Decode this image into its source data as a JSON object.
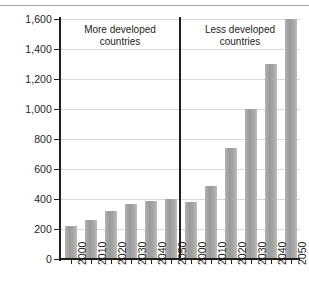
{
  "chart_data": {
    "type": "bar",
    "title": "",
    "xlabel": "",
    "ylabel": "Millions",
    "ylim": [
      0,
      1600
    ],
    "ytick_labels": [
      "1,600",
      "1,400",
      "1,200",
      "1,000",
      "800",
      "600",
      "400",
      "200",
      "0"
    ],
    "ytick_values": [
      1600,
      1400,
      1200,
      1000,
      800,
      600,
      400,
      200,
      0
    ],
    "grid": true,
    "legend": "none",
    "panels": [
      {
        "name": "more-developed",
        "title_line1": "More developed",
        "title_line2": "countries",
        "categories": [
          "2000",
          "2010",
          "2020",
          "2030",
          "2040",
          "2050"
        ],
        "values": [
          220,
          260,
          320,
          370,
          390,
          400
        ]
      },
      {
        "name": "less-developed",
        "title_line1": "Less developed",
        "title_line2": "countries",
        "categories": [
          "2000",
          "2010",
          "2020",
          "2030",
          "2040",
          "2050"
        ],
        "values": [
          380,
          490,
          740,
          1000,
          1300,
          1600
        ]
      }
    ],
    "bar_color": "#a3a3a3",
    "axis_color": "#231f20",
    "grid_color": "#d9d9d9"
  }
}
